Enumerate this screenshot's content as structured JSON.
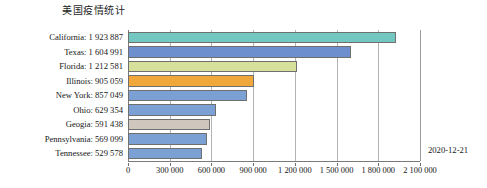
{
  "chart_data": {
    "type": "bar",
    "orientation": "horizontal",
    "title": "美国疫情统计",
    "xlabel": "",
    "ylabel": "",
    "grid": true,
    "legend": false,
    "xlim": [
      0,
      2100000
    ],
    "xticks": [
      0,
      300000,
      600000,
      900000,
      1200000,
      1500000,
      1800000,
      2100000
    ],
    "xtick_labels": [
      "0",
      "300 000",
      "600 000",
      "900 000",
      "1 200 000",
      "1 500 000",
      "1 800 000",
      "2 100 000"
    ],
    "categories": [
      "California",
      "Texas",
      "Florida",
      "Illinois",
      "New York",
      "Ohio",
      "Geogia",
      "Pennsylvania",
      "Tennessee"
    ],
    "values": [
      1923887,
      1604991,
      1212581,
      905059,
      857049,
      629354,
      591438,
      569099,
      529578
    ],
    "value_labels": [
      "1 923 887",
      "1 604 991",
      "1 212 581",
      "905 059",
      "857 049",
      "629 354",
      "591 438",
      "569 099",
      "529 578"
    ],
    "category_labels": [
      "California: 1 923 887",
      "Texas: 1 604 991",
      "Florida: 1 212 581",
      "Illinois: 905 059",
      "New York: 857 049",
      "Ohio: 629 354",
      "Geogia: 591 438",
      "Pennsylvania: 569 099",
      "Tennessee: 529 578"
    ],
    "bar_colors": [
      "#72c7c0",
      "#6d8fce",
      "#d6e09a",
      "#f0a83c",
      "#7ba0d4",
      "#7ba0d4",
      "#cfc7bd",
      "#7ba0d4",
      "#7ba0d4"
    ],
    "bar_edge_color": "#6f6f6f",
    "annotations": [
      {
        "name": "date-stamp",
        "text": "2020-12-21"
      }
    ]
  },
  "annotation": {
    "date": "2020-12-21"
  }
}
